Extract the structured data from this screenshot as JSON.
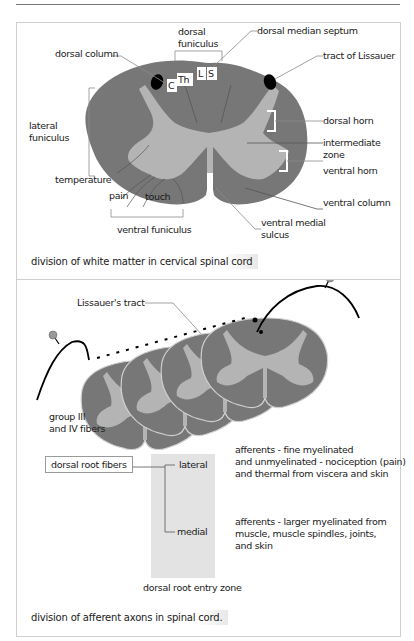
{
  "header": {
    "rule": true
  },
  "figure1": {
    "labels": {
      "dorsal_funiculus_1": "dorsal",
      "dorsal_funiculus_2": "funiculus",
      "dorsal_median_septum": "dorsal median septum",
      "dorsal_column": "dorsal column",
      "tract_of_lissauer": "tract of Lissauer",
      "seg_c": "C",
      "seg_th": "Th",
      "seg_l": "L",
      "seg_s": "S",
      "lateral_funiculus_1": "lateral",
      "lateral_funiculus_2": "funiculus",
      "dorsal_horn": "dorsal horn",
      "intermediate_zone_1": "intermediate",
      "intermediate_zone_2": "zone",
      "ventral_horn": "ventral horn",
      "temperature": "temperature",
      "pain": "pain",
      "touch": "touch",
      "ventral_column": "ventral column",
      "ventral_funiculus": "ventral funiculus",
      "ventral_medial_sulcus_1": "ventral medial",
      "ventral_medial_sulcus_2": "sulcus"
    },
    "caption": "division of white matter in cervical spinal cord",
    "colors": {
      "white_matter": "#777777",
      "gray_matter": "#b4b4b4",
      "tract": "#000000",
      "leader": "#8a8a8a"
    }
  },
  "figure2": {
    "labels": {
      "lissauers_tract": "Lissauer's tract",
      "group_fibers_1": "group III",
      "group_fibers_2": "and IV fibers",
      "dorsal_root_fibers": "dorsal root fibers",
      "lateral": "lateral",
      "medial": "medial",
      "entry_zone": "dorsal root entry zone",
      "lateral_desc_1": "afferents - fine myelinated",
      "lateral_desc_2": "and unmyelinated  - nociception (pain)",
      "lateral_desc_3": "and thermal from viscera and skin",
      "medial_desc_1": "afferents - larger myelinated from",
      "medial_desc_2": "muscle,  muscle spindles, joints,",
      "medial_desc_3": "and skin"
    },
    "caption": "division of afferent axons in spinal cord."
  }
}
